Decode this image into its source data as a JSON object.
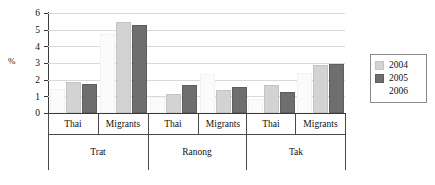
{
  "chart_data": {
    "type": "bar",
    "title": "",
    "subtitle": "",
    "xlabel": "",
    "ylabel": "%",
    "ylim": [
      0,
      6
    ],
    "yticks": [
      0,
      1,
      2,
      3,
      4,
      5,
      6
    ],
    "grid": true,
    "legend_position": "right",
    "categories": [
      "Thai",
      "Migrants",
      "Thai",
      "Migrants",
      "Thai",
      "Migrants"
    ],
    "groups": [
      {
        "name": "Trat",
        "categories": [
          "Thai",
          "Migrants"
        ]
      },
      {
        "name": "Ranong",
        "categories": [
          "Thai",
          "Migrants"
        ]
      },
      {
        "name": "Tak",
        "categories": [
          "Thai",
          "Migrants"
        ]
      }
    ],
    "series": [
      {
        "name": "2004",
        "color": "#d3d3d3",
        "values": [
          1.75,
          5.35,
          1.05,
          1.25,
          1.55,
          2.75
        ]
      },
      {
        "name": "2005",
        "color": "#6e6e6e",
        "values": [
          1.65,
          5.15,
          1.55,
          1.45,
          1.15,
          2.85
        ]
      },
      {
        "name": "2006",
        "color": "#ffffff",
        "values": [
          1.3,
          4.6,
          0.85,
          2.2,
          0.75,
          2.3
        ]
      }
    ]
  },
  "legend": {
    "items": [
      {
        "label": "2004",
        "swatch": "s2004"
      },
      {
        "label": "2005",
        "swatch": "s2005"
      },
      {
        "label": "2006",
        "swatch": "s2006"
      }
    ]
  },
  "axis": {
    "y_title": "%",
    "y_tick_labels": [
      "6",
      "5",
      "4",
      "3",
      "2",
      "1",
      "0"
    ]
  },
  "category_labels": [
    "Thai",
    "Migrants",
    "Thai",
    "Migrants",
    "Thai",
    "Migrants"
  ],
  "province_labels": [
    "Trat",
    "Ranong",
    "Tak"
  ]
}
